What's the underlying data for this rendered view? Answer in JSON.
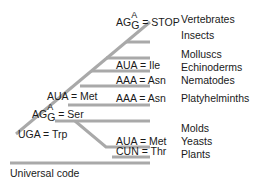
{
  "title": "Universal code",
  "colors": {
    "branch": "#a9a9a9",
    "text": "#1a1a1a",
    "background": "#ffffff"
  },
  "taxa": [
    {
      "label": "Vertebrates"
    },
    {
      "label": "Insects"
    },
    {
      "label": "Molluscs"
    },
    {
      "label": "Echinoderms"
    },
    {
      "label": "Nematodes"
    },
    {
      "label": "Platyhelminths"
    },
    {
      "label": "Molds"
    },
    {
      "label": "Yeasts"
    },
    {
      "label": "Plants"
    }
  ],
  "codon_changes": [
    {
      "prefix": "AG",
      "top": "A",
      "bottom": "G",
      "rest": " = STOP"
    },
    {
      "text": "AUA = Ile"
    },
    {
      "text": "AAA = Asn"
    },
    {
      "text": "AAA = Asn"
    },
    {
      "text": "AUA = Met"
    },
    {
      "prefix": "AG",
      "top": "A",
      "bottom": "G",
      "rest": " = Ser"
    },
    {
      "text": "UGA = Trp"
    },
    {
      "text": "AUA = Met"
    },
    {
      "text": "CUN = Thr"
    }
  ],
  "root_label": "Universal code"
}
